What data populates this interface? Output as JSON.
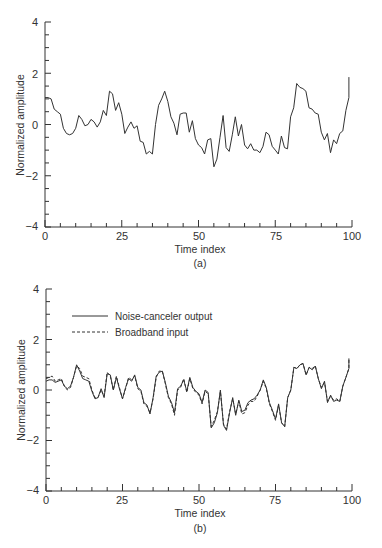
{
  "chart_data": [
    {
      "panel_label": "(a)",
      "type": "line",
      "title": "",
      "xlabel": "Time index",
      "ylabel": "Normalized amplitude",
      "xlim": [
        0,
        100
      ],
      "ylim": [
        -4,
        4
      ],
      "xticks": [
        0,
        25,
        50,
        75,
        100
      ],
      "yticks": [
        4,
        2,
        0,
        -2,
        -4
      ],
      "grid": false,
      "legend": null,
      "series": [
        {
          "name": "Signal",
          "style": "solid",
          "values": [
            1.05,
            1.05,
            1.0,
            0.6,
            0.5,
            0.4,
            -0.15,
            -0.35,
            -0.4,
            -0.35,
            -0.15,
            0.35,
            0.2,
            -0.05,
            0.0,
            0.2,
            0.1,
            -0.1,
            0.1,
            0.55,
            0.35,
            1.3,
            1.2,
            0.55,
            0.85,
            0.4,
            -0.35,
            -0.1,
            0.1,
            -0.15,
            -0.05,
            -0.65,
            -0.7,
            -1.15,
            -1.05,
            -1.15,
            0.0,
            0.75,
            1.0,
            1.3,
            0.9,
            0.3,
            0.05,
            -0.4,
            0.4,
            0.45,
            0.45,
            -0.3,
            0.15,
            -0.55,
            -0.8,
            -0.9,
            -1.15,
            -0.6,
            -0.55,
            -1.65,
            -1.35,
            -0.5,
            0.35,
            -0.9,
            -1.05,
            -0.4,
            0.3,
            -0.45,
            0.0,
            -0.8,
            -0.95,
            -0.75,
            -1.0,
            -1.0,
            -1.1,
            -0.85,
            -0.3,
            -0.4,
            -0.85,
            -1.0,
            -1.15,
            -0.45,
            -0.9,
            -0.95,
            0.3,
            0.65,
            1.6,
            1.45,
            1.4,
            1.3,
            0.65,
            0.6,
            0.45,
            0.4,
            -0.3,
            -0.6,
            -0.35,
            -1.1,
            -0.6,
            -0.75,
            -0.35,
            -0.25,
            0.55,
            1.05,
            1.85
          ]
        }
      ]
    },
    {
      "panel_label": "(b)",
      "type": "line",
      "title": "",
      "xlabel": "Time index",
      "ylabel": "Normalized amplitude",
      "xlim": [
        0,
        100
      ],
      "ylim": [
        -4,
        4
      ],
      "xticks": [
        0,
        25,
        50,
        75,
        100
      ],
      "yticks": [
        4,
        2,
        0,
        -2,
        -4
      ],
      "grid": false,
      "legend": {
        "position": "upper left",
        "entries": [
          "Noise-canceler output",
          "Broadband input"
        ]
      },
      "series": [
        {
          "name": "Noise-canceler output",
          "style": "solid",
          "values": [
            0.35,
            0.4,
            0.4,
            0.3,
            0.35,
            0.4,
            0.15,
            0.05,
            0.15,
            0.5,
            1.0,
            0.75,
            0.45,
            0.4,
            0.35,
            -0.05,
            -0.35,
            -0.3,
            0.05,
            -0.3,
            0.65,
            0.6,
            0.0,
            0.5,
            0.05,
            -0.35,
            0.1,
            0.45,
            0.35,
            0.6,
            0.1,
            0.0,
            -0.5,
            -0.6,
            -0.95,
            -0.3,
            0.55,
            0.7,
            0.75,
            0.3,
            -0.25,
            -0.5,
            -0.9,
            0.05,
            0.15,
            0.4,
            -0.05,
            0.5,
            0.1,
            -0.05,
            -0.15,
            -0.5,
            0.0,
            -0.1,
            -1.5,
            -1.3,
            -0.9,
            0.0,
            -1.4,
            -1.6,
            -0.9,
            -0.3,
            -1.0,
            -0.4,
            -0.85,
            -0.8,
            -0.5,
            -0.4,
            -0.35,
            -0.2,
            0.0,
            0.4,
            0.1,
            -0.5,
            -0.8,
            -1.15,
            -0.55,
            -1.3,
            -1.45,
            -0.3,
            0.0,
            0.9,
            0.85,
            1.0,
            1.05,
            0.6,
            0.9,
            0.8,
            0.95,
            0.45,
            0.05,
            0.35,
            -0.5,
            -0.2,
            -0.45,
            -0.4,
            -0.45,
            0.15,
            0.5,
            0.85,
            1.25
          ]
        },
        {
          "name": "Broadband input",
          "style": "dashed",
          "values": [
            0.45,
            0.5,
            0.55,
            0.35,
            0.4,
            0.45,
            0.15,
            0.0,
            0.1,
            0.5,
            0.95,
            0.85,
            0.55,
            0.5,
            0.45,
            0.0,
            -0.3,
            -0.3,
            0.0,
            -0.25,
            0.7,
            0.55,
            0.0,
            0.55,
            0.1,
            -0.35,
            0.05,
            0.5,
            0.4,
            0.55,
            0.05,
            -0.05,
            -0.55,
            -0.65,
            -0.9,
            -0.35,
            0.5,
            0.75,
            0.75,
            0.25,
            -0.3,
            -0.55,
            -1.0,
            0.0,
            0.1,
            0.45,
            -0.1,
            0.45,
            0.05,
            -0.1,
            -0.2,
            -0.55,
            -0.05,
            -0.15,
            -1.45,
            -1.2,
            -0.85,
            -0.05,
            -1.35,
            -1.55,
            -0.85,
            -0.35,
            -0.95,
            -0.45,
            -0.95,
            -0.9,
            -0.6,
            -0.45,
            -0.45,
            -0.25,
            0.0,
            0.35,
            0.05,
            -0.55,
            -0.85,
            -1.2,
            -0.6,
            -1.3,
            -1.45,
            -0.3,
            0.0,
            0.9,
            0.85,
            1.0,
            1.05,
            0.6,
            0.9,
            0.85,
            0.95,
            0.45,
            0.1,
            0.3,
            -0.45,
            -0.25,
            -0.4,
            -0.35,
            -0.45,
            0.15,
            0.5,
            0.85,
            1.25
          ]
        }
      ]
    }
  ],
  "panels": {
    "a": {
      "label": "(a)",
      "xlabel": "Time index",
      "ylabel": "Normalized amplitude",
      "x_tick_labels": [
        "0",
        "25",
        "50",
        "75",
        "100"
      ],
      "y_tick_labels": [
        "4",
        "2",
        "0",
        "−2",
        "−4"
      ]
    },
    "b": {
      "label": "(b)",
      "xlabel": "Time index",
      "ylabel": "Normalized amplitude",
      "x_tick_labels": [
        "0",
        "25",
        "50",
        "75",
        "100"
      ],
      "y_tick_labels": [
        "4",
        "2",
        "0",
        "−2",
        "−4"
      ],
      "legend": {
        "solid_label": "Noise-canceler output",
        "dashed_label": "Broadband input"
      }
    }
  }
}
